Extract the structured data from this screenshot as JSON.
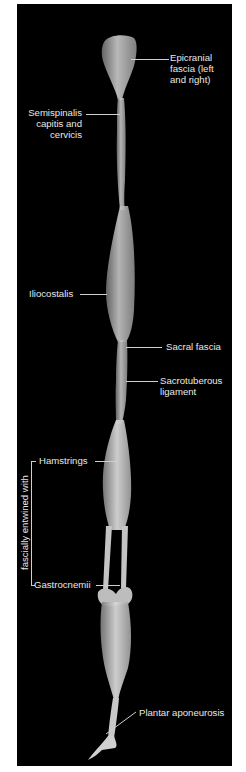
{
  "figure": {
    "background_color": "#000000",
    "label_color": "#e8e8e8",
    "labels": {
      "epicranial": [
        "Epicranial",
        "fascia (left",
        "and right)"
      ],
      "semispinalis": [
        "Semispinalis",
        "capitis and",
        "cervicis"
      ],
      "iliocostalis": "Iliocostalis",
      "sacral_fascia": "Sacral fascia",
      "sacrotuberous": [
        "Sacrotuberous",
        "ligament"
      ],
      "hamstrings": "Hamstrings",
      "gastrocnemii": "Gastrocnemii",
      "plantar": "Plantar aponeurosis",
      "bracket": "fascially entwined with"
    }
  }
}
